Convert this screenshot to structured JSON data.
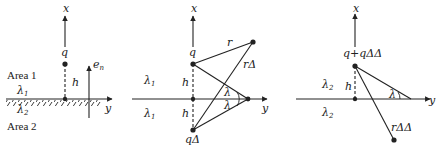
{
  "panels": [
    {
      "id": "panel-1",
      "labels": {
        "x_axis": "x",
        "y_axis": "y",
        "charge": "q",
        "height": "h",
        "normal": "e",
        "normal_sub": "n",
        "area1": "Area 1",
        "area2": "Area 2",
        "lambda_top": "λ",
        "lambda_top_sub": "1",
        "lambda_bottom": "λ",
        "lambda_bottom_sub": "2"
      }
    },
    {
      "id": "panel-2",
      "labels": {
        "x_axis": "x",
        "y_axis": "y",
        "charge": "q",
        "image_charge": "qΔ",
        "height_top": "h",
        "height_bottom": "h",
        "r": "r",
        "r_delta": "rΔ",
        "angle_top": "λ",
        "angle_bottom": "λ",
        "lambda_top": "λ",
        "lambda_top_sub": "1",
        "lambda_bottom": "λ",
        "lambda_bottom_sub": "1"
      }
    },
    {
      "id": "panel-3",
      "labels": {
        "x_axis": "x",
        "y_axis": "y",
        "charge": "q+qΔΔ",
        "height": "h",
        "r_delta": "rΔΔ",
        "angle": "λ",
        "lambda_top": "λ",
        "lambda_top_sub": "2",
        "lambda_bottom": "λ",
        "lambda_bottom_sub": "2"
      }
    }
  ],
  "colors": {
    "line": "#222222",
    "background": "#ffffff"
  }
}
